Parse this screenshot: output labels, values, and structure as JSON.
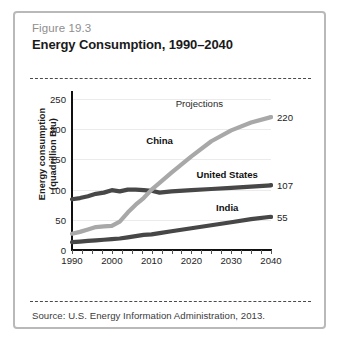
{
  "figure": {
    "number": "Figure 19.3",
    "title": "Energy Consumption, 1990–2040",
    "source": "Source: U.S. Energy Information Administration, 2013."
  },
  "colors": {
    "card_border": "#b9b9b9",
    "china_line": "#a8a8a8",
    "us_line": "#474747",
    "india_line": "#474747",
    "gridline": "#ebebeb",
    "axis": "#101010",
    "fig_number_text": "#8e8e8e",
    "title_text": "#1a1a1a"
  },
  "chart_data": {
    "type": "line",
    "title": "Energy Consumption, 1990–2040",
    "xlabel": "",
    "ylabel": "Energy consumption (quadrillion Btu)",
    "xlim": [
      1990,
      2040
    ],
    "ylim": [
      0,
      250
    ],
    "yticks": [
      0,
      50,
      100,
      150,
      200,
      250
    ],
    "xticks": [
      1990,
      2000,
      2010,
      2020,
      2030,
      2040
    ],
    "grid": true,
    "legend": "inline-labels",
    "annotations": [
      {
        "text": "Projections",
        "x": 2022,
        "y": 243
      },
      {
        "text": "China",
        "x": 2012,
        "y": 182
      },
      {
        "text": "United States",
        "x": 2029,
        "y": 126
      },
      {
        "text": "India",
        "x": 2029,
        "y": 72
      }
    ],
    "x": [
      1990,
      1992,
      1994,
      1996,
      1998,
      2000,
      2002,
      2004,
      2006,
      2008,
      2010,
      2012,
      2015,
      2020,
      2025,
      2030,
      2035,
      2040
    ],
    "series": [
      {
        "name": "China",
        "color": "#a8a8a8",
        "end_label": "220",
        "values": [
          27,
          30,
          34,
          38,
          39,
          40,
          47,
          62,
          75,
          86,
          100,
          111,
          128,
          155,
          180,
          198,
          211,
          220
        ]
      },
      {
        "name": "United States",
        "color": "#474747",
        "end_label": "107",
        "values": [
          84,
          86,
          89,
          93,
          95,
          99,
          97,
          100,
          100,
          99,
          98,
          95,
          97,
          99,
          101,
          103,
          105,
          107
        ]
      },
      {
        "name": "India",
        "color": "#474747",
        "end_label": "55",
        "values": [
          13,
          14,
          15,
          16,
          17,
          18,
          19,
          21,
          23,
          25,
          26,
          28,
          31,
          36,
          41,
          46,
          51,
          55
        ]
      }
    ]
  }
}
